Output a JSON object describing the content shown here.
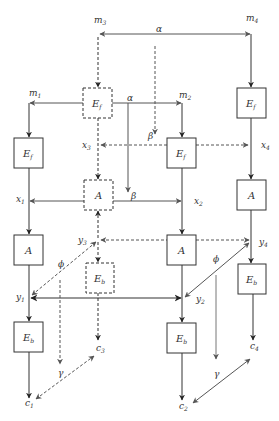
{
  "diagram": {
    "type": "flow-network",
    "colors": {
      "solid": "#333333",
      "dashed": "#555555",
      "gray": "#777777",
      "background": "#ffffff"
    },
    "nodes": {
      "m1": {
        "label": "m",
        "sub": "1"
      },
      "m2": {
        "label": "m",
        "sub": "2"
      },
      "m3": {
        "label": "m",
        "sub": "3"
      },
      "m4": {
        "label": "m",
        "sub": "4"
      },
      "x1": {
        "label": "x",
        "sub": "1"
      },
      "x2": {
        "label": "x",
        "sub": "2"
      },
      "x3": {
        "label": "x",
        "sub": "3"
      },
      "x4": {
        "label": "x",
        "sub": "4"
      },
      "y1": {
        "label": "y",
        "sub": "1"
      },
      "y2": {
        "label": "y",
        "sub": "2"
      },
      "y3": {
        "label": "y",
        "sub": "3"
      },
      "y4": {
        "label": "y",
        "sub": "4"
      },
      "c1": {
        "label": "c",
        "sub": "1"
      },
      "c2": {
        "label": "c",
        "sub": "2"
      },
      "c3": {
        "label": "c",
        "sub": "3"
      },
      "c4": {
        "label": "c",
        "sub": "4"
      }
    },
    "boxes": {
      "ef1": {
        "label": "E",
        "sub": "f",
        "style": "solid"
      },
      "ef2": {
        "label": "E",
        "sub": "f",
        "style": "solid"
      },
      "ef3": {
        "label": "E",
        "sub": "f",
        "style": "dashed"
      },
      "ef4": {
        "label": "E",
        "sub": "f",
        "style": "solid"
      },
      "a1": {
        "label": "A",
        "style": "solid"
      },
      "a2": {
        "label": "A",
        "style": "solid"
      },
      "a3": {
        "label": "A",
        "style": "dashed"
      },
      "a4": {
        "label": "A",
        "style": "solid"
      },
      "eb1": {
        "label": "E",
        "sub": "b",
        "style": "solid"
      },
      "eb2": {
        "label": "E",
        "sub": "b",
        "style": "solid"
      },
      "eb3": {
        "label": "E",
        "sub": "b",
        "style": "dashed"
      },
      "eb4": {
        "label": "E",
        "sub": "b",
        "style": "solid"
      }
    },
    "edge_labels": {
      "alpha_top": "α",
      "alpha_mid": "α",
      "beta_dashed": "β",
      "beta_solid": "β",
      "phi_left": "ϕ",
      "phi_right": "ϕ",
      "gamma_left": "γ",
      "gamma_right": "γ"
    }
  }
}
